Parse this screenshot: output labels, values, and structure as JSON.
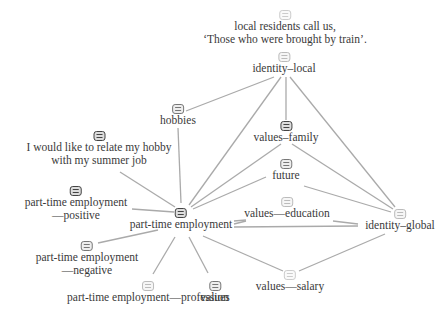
{
  "nodes": [
    {
      "id": "quote-train",
      "label_lines": [
        "local residents call us,",
        "‘Those who were brought by train’."
      ],
      "x": 285,
      "y": 10,
      "icon_shade": "vlight"
    },
    {
      "id": "identity-local",
      "label_lines": [
        "identity–local"
      ],
      "x": 284,
      "y": 52,
      "icon_shade": "light"
    },
    {
      "id": "hobbies",
      "label_lines": [
        "hobbies"
      ],
      "x": 178,
      "y": 104,
      "icon_shade": "mid"
    },
    {
      "id": "values-family",
      "label_lines": [
        "values–family"
      ],
      "x": 286,
      "y": 121,
      "icon_shade": "dark"
    },
    {
      "id": "hobby-summer-job",
      "label_lines": [
        "I would like to relate my hobby",
        "with my summer job"
      ],
      "x": 99,
      "y": 131,
      "icon_shade": "dark"
    },
    {
      "id": "future",
      "label_lines": [
        "future"
      ],
      "x": 286,
      "y": 159,
      "icon_shade": "mid"
    },
    {
      "id": "pte-positive",
      "label_lines": [
        "part-time employment",
        "—positive"
      ],
      "x": 76,
      "y": 186,
      "icon_shade": "dark"
    },
    {
      "id": "values-education",
      "label_lines": [
        "values—education"
      ],
      "x": 287,
      "y": 197,
      "icon_shade": "light"
    },
    {
      "id": "part-time-employment",
      "label_lines": [
        "part-time employment"
      ],
      "x": 181,
      "y": 208,
      "icon_shade": "dark"
    },
    {
      "id": "identity-global",
      "label_lines": [
        "identity–global"
      ],
      "x": 400,
      "y": 209,
      "icon_shade": "light"
    },
    {
      "id": "pte-negative",
      "label_lines": [
        "part-time employment",
        "—negative"
      ],
      "x": 87,
      "y": 241,
      "icon_shade": "mid"
    },
    {
      "id": "values-salary",
      "label_lines": [
        "values—salary"
      ],
      "x": 290,
      "y": 270,
      "icon_shade": "vlight"
    },
    {
      "id": "pte-profession",
      "label_lines": [
        "part-time employment—profession"
      ],
      "x": 148,
      "y": 281,
      "icon_shade": "light"
    },
    {
      "id": "values",
      "label_lines": [
        "values"
      ],
      "x": 215,
      "y": 281,
      "icon_shade": "mid"
    }
  ],
  "edges": [
    {
      "from": "identity-local",
      "to": "hobbies",
      "x1": 274,
      "y1": 77,
      "x2": 186,
      "y2": 111
    },
    {
      "from": "identity-local",
      "to": "part-time-employment",
      "x1": 281,
      "y1": 77,
      "x2": 189,
      "y2": 205
    },
    {
      "from": "identity-local",
      "to": "values-family",
      "x1": 286,
      "y1": 77,
      "x2": 286,
      "y2": 120
    },
    {
      "from": "identity-local",
      "to": "identity-global",
      "x1": 290,
      "y1": 77,
      "x2": 395,
      "y2": 207
    },
    {
      "from": "hobbies",
      "to": "part-time-employment",
      "x1": 178,
      "y1": 128,
      "x2": 181,
      "y2": 203
    },
    {
      "from": "values-family",
      "to": "part-time-employment",
      "x1": 281,
      "y1": 144,
      "x2": 191,
      "y2": 207
    },
    {
      "from": "values-family",
      "to": "identity-global",
      "x1": 292,
      "y1": 144,
      "x2": 393,
      "y2": 209
    },
    {
      "from": "future",
      "to": "part-time-employment",
      "x1": 266,
      "y1": 177,
      "x2": 193,
      "y2": 209
    },
    {
      "from": "future",
      "to": "identity-global",
      "x1": 304,
      "y1": 186,
      "x2": 391,
      "y2": 212
    },
    {
      "from": "hobby-summer-job",
      "to": "part-time-employment",
      "x1": 120,
      "y1": 172,
      "x2": 175,
      "y2": 207
    },
    {
      "from": "pte-positive",
      "to": "part-time-employment",
      "x1": 132,
      "y1": 209,
      "x2": 174,
      "y2": 212
    },
    {
      "from": "part-time-employment",
      "to": "values-education",
      "x1": 234,
      "y1": 221,
      "x2": 246,
      "y2": 220
    },
    {
      "from": "part-time-employment",
      "to": "values-education",
      "x1": 234,
      "y1": 224,
      "x2": 246,
      "y2": 221
    },
    {
      "from": "values-education",
      "to": "identity-global",
      "x1": 333,
      "y1": 221,
      "x2": 358,
      "y2": 224
    },
    {
      "from": "part-time-employment",
      "to": "identity-global",
      "x1": 234,
      "y1": 227,
      "x2": 358,
      "y2": 226
    },
    {
      "from": "part-time-employment",
      "to": "pte-negative",
      "x1": 158,
      "y1": 230,
      "x2": 98,
      "y2": 243
    },
    {
      "from": "part-time-employment",
      "to": "pte-profession",
      "x1": 175,
      "y1": 237,
      "x2": 153,
      "y2": 274
    },
    {
      "from": "part-time-employment",
      "to": "values",
      "x1": 189,
      "y1": 237,
      "x2": 208,
      "y2": 273
    },
    {
      "from": "part-time-employment",
      "to": "values-salary",
      "x1": 203,
      "y1": 236,
      "x2": 283,
      "y2": 271
    },
    {
      "from": "values-salary",
      "to": "identity-global",
      "x1": 299,
      "y1": 271,
      "x2": 385,
      "y2": 234
    }
  ],
  "colors": {
    "edge": "#aaaaaa",
    "text": "#3a3a3a",
    "background": "#ffffff"
  }
}
